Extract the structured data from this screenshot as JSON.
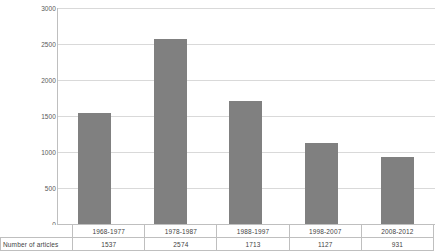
{
  "chart_data": {
    "type": "bar",
    "title": "",
    "xlabel": "",
    "ylabel": "",
    "categories": [
      "1968-1977",
      "1978-1987",
      "1988-1997",
      "1998-2007",
      "2008-2012"
    ],
    "values": [
      1537,
      2574,
      1713,
      1127,
      931
    ],
    "series": [
      {
        "name": "Number of articles",
        "values": [
          1537,
          2574,
          1713,
          1127,
          931
        ]
      }
    ],
    "ylim": [
      0,
      3000
    ],
    "ytick_labels": [
      "3000",
      "2500",
      "2000",
      "1500",
      "1000",
      "500",
      "0"
    ],
    "ytick_values": [
      3000,
      2500,
      2000,
      1500,
      1000,
      500,
      0
    ],
    "grid": true,
    "legend": "none",
    "bar_color": "#808080",
    "gridline_color": "#d9d9d9",
    "axis_color": "#bfbfbf"
  },
  "table": {
    "row_header": "Number of articles",
    "category_row": [
      "1968-1977",
      "1978-1987",
      "1988-1997",
      "1998-2007",
      "2008-2012"
    ],
    "value_row": [
      "1537",
      "2574",
      "1713",
      "1127",
      "931"
    ]
  }
}
